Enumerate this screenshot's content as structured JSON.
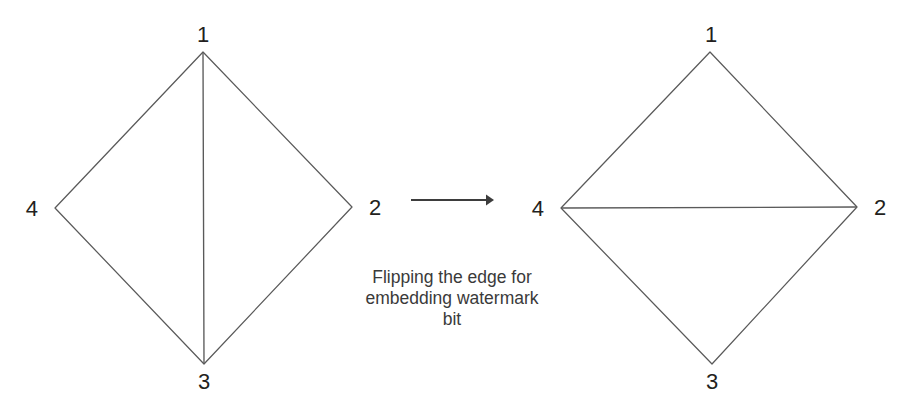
{
  "figure": {
    "background": "#ffffff",
    "line_color": "#5a5a5a",
    "text_color": "#231f20",
    "caption_color": "#3a3a3a"
  },
  "left_diagram": {
    "name": "quadrilateral-before-flip",
    "vertices": [
      {
        "id": "1",
        "label": "1",
        "x": 203,
        "y": 52,
        "label_x": 203,
        "label_y": 42
      },
      {
        "id": "2",
        "label": "2",
        "x": 352,
        "y": 207,
        "label_x": 369,
        "label_y": 215
      },
      {
        "id": "3",
        "label": "3",
        "x": 204,
        "y": 364,
        "label_x": 204,
        "label_y": 389
      },
      {
        "id": "4",
        "label": "4",
        "x": 55,
        "y": 208,
        "label_x": 38,
        "label_y": 216
      }
    ],
    "boundary_path": "M 203 52 L 352 207 L 204 364 L 55 208 Z",
    "diagonal": {
      "name": "edge-1-3",
      "from": "1",
      "to": "3",
      "path": "M 203 53 L 204 363"
    }
  },
  "right_diagram": {
    "name": "quadrilateral-after-flip",
    "vertices": [
      {
        "id": "1",
        "label": "1",
        "x": 710,
        "y": 52,
        "label_x": 711,
        "label_y": 42
      },
      {
        "id": "2",
        "label": "2",
        "x": 857,
        "y": 207,
        "label_x": 874,
        "label_y": 215
      },
      {
        "id": "3",
        "label": "3",
        "x": 712,
        "y": 364,
        "label_x": 712,
        "label_y": 389
      },
      {
        "id": "4",
        "label": "4",
        "x": 561,
        "y": 208,
        "label_x": 544,
        "label_y": 216
      }
    ],
    "boundary_path": "M 710 52 L 857 207 L 712 364 L 561 208 Z",
    "diagonal": {
      "name": "edge-4-2",
      "from": "4",
      "to": "2",
      "path": "M 562 208 L 856 207"
    }
  },
  "arrow": {
    "name": "transformation-arrow",
    "shaft": {
      "x1": 411,
      "y1": 200,
      "x2": 486,
      "y2": 200
    },
    "head": "M 486 194.5 L 494 200 L 486 205.5 Z"
  },
  "caption": {
    "lines": [
      "Flipping the edge for",
      "embedding watermark",
      "bit"
    ],
    "center_x": 452,
    "line_y": [
      283,
      304,
      325
    ]
  }
}
